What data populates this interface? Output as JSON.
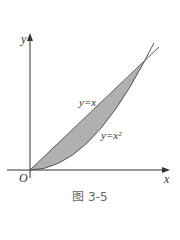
{
  "figure": {
    "caption": "图 3-5",
    "axis_x_label": "x",
    "axis_y_label": "y",
    "origin_label": "O",
    "curve_line_label": "y=x",
    "curve_parabola_label": "y=x²",
    "region": "shaded region between y=x and y=x² from 0 to 1",
    "colors": {
      "fill": "#b0b0b0",
      "stroke": "#555555",
      "axis": "#333333"
    }
  }
}
